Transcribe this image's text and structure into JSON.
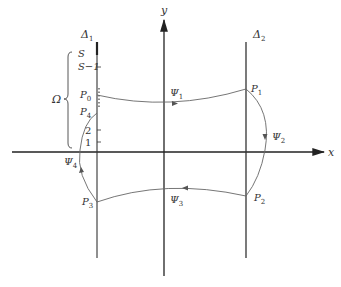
{
  "diagram": {
    "axes": {
      "x_label": "x",
      "y_label": "y"
    },
    "lines": {
      "delta1": {
        "name": "Δ",
        "sub": "1"
      },
      "delta2": {
        "name": "Δ",
        "sub": "2"
      }
    },
    "delta1_ticks": {
      "S": "S",
      "S_minus_1": "S−1",
      "two": "2",
      "one": "1"
    },
    "brace_label": "Ω",
    "points": {
      "P0": {
        "name": "P",
        "sub": "0"
      },
      "P1": {
        "name": "P",
        "sub": "1"
      },
      "P2": {
        "name": "P",
        "sub": "2"
      },
      "P3": {
        "name": "P",
        "sub": "3"
      },
      "P4": {
        "name": "P",
        "sub": "4"
      }
    },
    "paths": {
      "psi1": {
        "name": "Ψ",
        "sub": "1"
      },
      "psi2": {
        "name": "Ψ",
        "sub": "2"
      },
      "psi3": {
        "name": "Ψ",
        "sub": "3"
      },
      "psi4": {
        "name": "Ψ",
        "sub": "4"
      }
    },
    "colors": {
      "axis": "#222222",
      "curve": "#666666",
      "text": "#333333"
    }
  }
}
